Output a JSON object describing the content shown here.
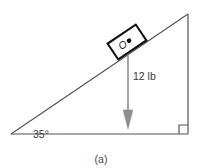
{
  "figure": {
    "caption": "(a)",
    "type": "free-body-diagram-inclined-plane",
    "labels": {
      "angle": "35°",
      "force": "12 lb",
      "point": "O"
    },
    "colors": {
      "line": "#555555",
      "block_stroke": "#111111",
      "arrow": "#8a8a8a",
      "text": "#3a3a3a",
      "background": "#ffffff"
    },
    "geometry": {
      "triangle": {
        "left_vertex": [
          11,
          134
        ],
        "right_vertex": [
          188,
          134
        ],
        "apex": [
          188,
          14
        ],
        "incline_angle_deg": 35,
        "right_angle_marker": true
      },
      "block": {
        "center": [
          127,
          42
        ],
        "width": 34,
        "height": 18,
        "rotation_deg": -34,
        "dot_offset": [
          6,
          0
        ]
      },
      "force_vector": {
        "from": [
          128,
          52
        ],
        "to": [
          128,
          128
        ],
        "direction": "down",
        "magnitude_text": "12 lb"
      }
    }
  }
}
